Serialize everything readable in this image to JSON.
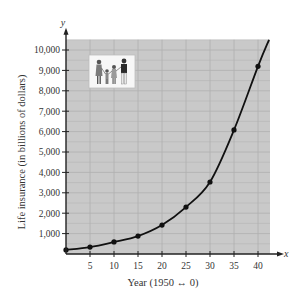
{
  "chart_data": {
    "type": "line",
    "title": "",
    "xlabel": "Year (1950 ↔ 0)",
    "ylabel": "Life insurance (in billions of dollars)",
    "x_axis_var": "x",
    "y_axis_var": "y",
    "x_ticks": [
      5,
      10,
      15,
      20,
      25,
      30,
      35,
      40
    ],
    "x_tick_labels": [
      "5",
      "10",
      "15",
      "20",
      "25",
      "30",
      "35",
      "40"
    ],
    "y_ticks": [
      1000,
      2000,
      3000,
      4000,
      5000,
      6000,
      7000,
      8000,
      9000,
      10000
    ],
    "y_tick_labels": [
      "1,000",
      "2,000",
      "3,000",
      "4,000",
      "5,000",
      "6,000",
      "7,000",
      "8,000",
      "9,000",
      "10,000"
    ],
    "xlim": [
      0,
      42.5
    ],
    "ylim": [
      0,
      10500
    ],
    "grid": true,
    "legend": null,
    "series": [
      {
        "name": "Life insurance",
        "markers": true,
        "fitted_curve": true,
        "x": [
          0,
          5,
          10,
          15,
          20,
          25,
          30,
          35,
          40
        ],
        "values": [
          200,
          340,
          590,
          880,
          1420,
          2300,
          3530,
          6080,
          9200
        ]
      }
    ],
    "annotations": [
      {
        "type": "image",
        "description": "family-illustration",
        "position": "upper-left inside plot"
      }
    ],
    "colors": {
      "plot_background": "#c9c9c9",
      "grid": "#b0b0b0",
      "curve": "#111111",
      "axes": "#222222"
    }
  }
}
